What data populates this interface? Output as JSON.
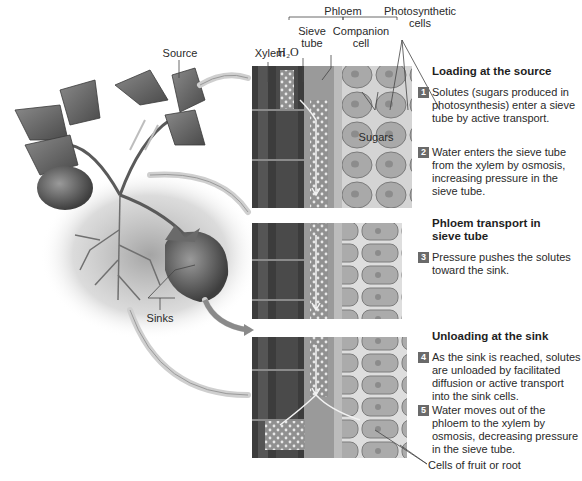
{
  "labels": {
    "source": "Source",
    "sinks": "Sinks",
    "xylem": "Xylem",
    "h2o": "H₂O",
    "phloem": "Phloem",
    "sieve_tube": [
      "Sieve",
      "tube"
    ],
    "companion_cell": [
      "Companion",
      "cell"
    ],
    "photosynthetic_cells": [
      "Photosynthetic",
      "cells"
    ],
    "sugars": "Sugars",
    "cells_of_fruit_or_root": "Cells of fruit or root"
  },
  "sections": [
    {
      "title": [
        "Loading at the source"
      ],
      "steps": [
        {
          "number": "1",
          "text": "Solutes (sugars produced in photosynthesis) enter a sieve tube by active transport."
        },
        {
          "number": "2",
          "text": "Water enters the sieve tube from the xylem by osmosis, increasing pressure in the sieve tube."
        }
      ]
    },
    {
      "title": [
        "Phloem transport in",
        "sieve tube"
      ],
      "steps": [
        {
          "number": "3",
          "text": "Pressure pushes the solutes toward the sink."
        }
      ]
    },
    {
      "title": [
        "Unloading at the sink"
      ],
      "steps": [
        {
          "number": "4",
          "text": "As the sink is reached, solutes are unloaded by facilitated diffusion or active transport into the sink cells."
        },
        {
          "number": "5",
          "text": "Water moves out of the phloem to the xylem by osmosis, decreasing pressure in the sieve tube."
        }
      ]
    }
  ],
  "colors": {
    "badge": "#6a6a6a",
    "xylem_dark": "#3a3a3a",
    "phloem_mid": "#8a8a8a",
    "cells": "#a8a8a8",
    "arrow": "#d8d8d8"
  }
}
